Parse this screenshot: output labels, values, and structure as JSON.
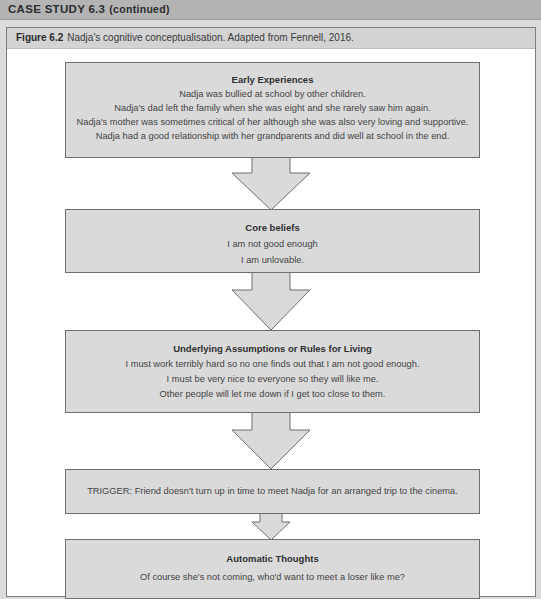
{
  "header": {
    "title": "CASE STUDY 6.3",
    "continued": "(continued)"
  },
  "figure": {
    "number": "Figure 6.2",
    "caption": "Nadja's cognitive conceptualisation. Adapted from Fennell, 2016."
  },
  "boxes": {
    "early_experiences": {
      "title": "Early Experiences",
      "lines": [
        "Nadja was bullied at school by other children.",
        "Nadja's dad left the family when she was eight and she rarely saw him again.",
        "Nadja's mother was sometimes critical of her although she was also very loving and supportive.",
        "Nadja had a good relationship with her grandparents and did well at school in the end."
      ]
    },
    "core_beliefs": {
      "title": "Core beliefs",
      "lines": [
        "I am not good enough",
        "I am unlovable."
      ]
    },
    "underlying_assumptions": {
      "title": "Underlying Assumptions or Rules for Living",
      "lines": [
        "I must work terribly hard so no one finds out that I am not good enough.",
        "I must be very nice to everyone so they will like me.",
        "Other people will let me down if I get too close to them."
      ]
    },
    "trigger": {
      "text": "TRIGGER: Friend doesn't turn up in time to meet Nadja for an arranged trip to the cinema."
    },
    "automatic_thoughts": {
      "title": "Automatic Thoughts",
      "lines": [
        "Of course she's not coming, who'd want to meet a loser like me?"
      ]
    }
  },
  "colors": {
    "header_bg": "#b4b4b4",
    "page_bg": "#dcdcdc",
    "caption_bg": "#d3d3d3",
    "box_fill": "#dadada",
    "box_border": "#6f6f6f"
  }
}
